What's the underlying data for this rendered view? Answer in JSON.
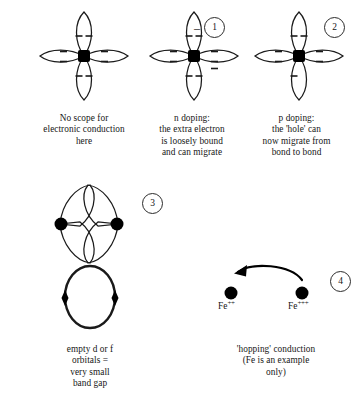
{
  "diagram": {
    "stroke_color": "#1a1a1a",
    "atom_color": "#000000",
    "background": "#ffffff"
  },
  "panels": [
    {
      "id": "panel-1",
      "figure": "four-lobe-orbital-filled",
      "badge": null,
      "charge_sign": null,
      "caption_lines": [
        "No scope for",
        "electronic conduction",
        "here"
      ],
      "electron_pairs": {
        "top": 2,
        "bottom": 2,
        "left": 2,
        "right": 2
      }
    },
    {
      "id": "panel-2",
      "figure": "four-lobe-orbital-extra-electron",
      "badge": "1",
      "charge_sign": "–",
      "caption_lines": [
        "n doping:",
        "the extra electron",
        "is loosely bound",
        "and can migrate"
      ],
      "electron_pairs": {
        "top": 2,
        "bottom": 2,
        "left": 2,
        "right": 2,
        "extra": 1
      }
    },
    {
      "id": "panel-3",
      "figure": "four-lobe-orbital-hole",
      "badge": "2",
      "charge_sign": null,
      "caption_lines": [
        "p doping:",
        "the 'hole' can",
        "now migrate from",
        "bond to bond"
      ],
      "electron_pairs": {
        "top": 2,
        "bottom": 1,
        "left": 2,
        "right": 2
      }
    },
    {
      "id": "panel-4",
      "figure": "overlapping-orbitals-and-band-loop",
      "badge": "3",
      "charge_sign": null,
      "caption_lines": [
        "empty d or f",
        "orbitals =",
        "very small",
        "band gap"
      ]
    },
    {
      "id": "panel-5",
      "figure": "hopping-conduction-fe-ions",
      "badge": "4",
      "charge_sign": null,
      "caption_lines": [
        "'hopping' conduction",
        "(Fe is an example",
        "only)"
      ],
      "ions": [
        {
          "element": "Fe",
          "charge": "++"
        },
        {
          "element": "Fe",
          "charge": "+++"
        }
      ],
      "arrow_direction": "right-to-left"
    }
  ]
}
